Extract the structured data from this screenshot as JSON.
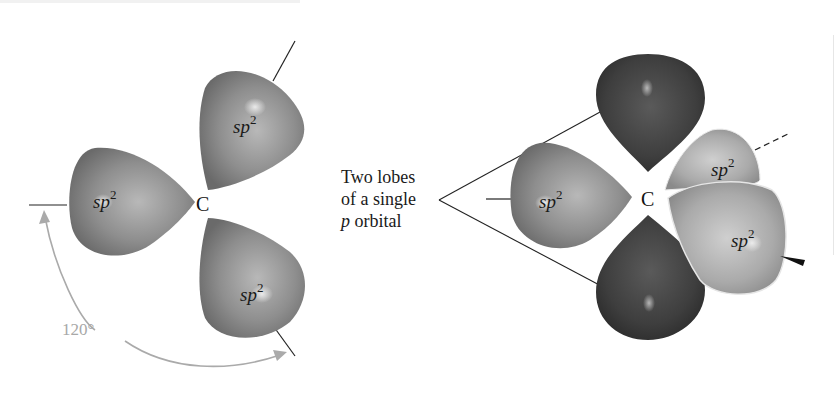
{
  "figure": {
    "left_panel": {
      "center_atom": "C",
      "lobes": [
        {
          "position": "upper-right",
          "label_base": "sp",
          "label_sup": "2"
        },
        {
          "position": "left",
          "label_base": "sp",
          "label_sup": "2"
        },
        {
          "position": "lower-right",
          "label_base": "sp",
          "label_sup": "2"
        }
      ],
      "angle_label": "120°"
    },
    "caption": {
      "line1": "Two lobes",
      "line2": "of a single",
      "line3_italic": "p",
      "line3_rest": " orbital"
    },
    "right_panel": {
      "center_atom": "C",
      "lobes": [
        {
          "position": "left",
          "label_base": "sp",
          "label_sup": "2"
        },
        {
          "position": "upper-right-back",
          "label_base": "sp",
          "label_sup": "2"
        },
        {
          "position": "lower-right-front",
          "label_base": "sp",
          "label_sup": "2"
        }
      ],
      "p_orbital_lobes": [
        "top",
        "bottom"
      ]
    },
    "colors": {
      "sp2_lobe": "#8a8a8a",
      "sp2_lobe_light": "#b4b4b4",
      "p_lobe": "#3c3c3c",
      "angle_arrow": "#a8a8a8",
      "text": "#1a1a1a"
    }
  }
}
